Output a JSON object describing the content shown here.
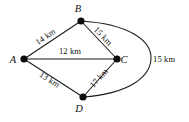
{
  "figure": {
    "background_color": "#ffffff",
    "line_color": "#1a1a1a",
    "node_color": "#0d0d0d",
    "text_color": "#111111"
  },
  "nodes": [
    {
      "id": "A",
      "label": "A",
      "x": 24,
      "y": 59,
      "label_x": 13,
      "label_y": 62.5,
      "radius": 3.6
    },
    {
      "id": "B",
      "label": "B",
      "x": 81,
      "y": 21,
      "label_x": 78,
      "label_y": 12,
      "radius": 3.6
    },
    {
      "id": "C",
      "label": "C",
      "x": 117,
      "y": 59,
      "label_x": 124,
      "label_y": 63,
      "radius": 3.6
    },
    {
      "id": "D",
      "label": "D",
      "x": 83,
      "y": 97,
      "label_x": 79,
      "label_y": 112,
      "radius": 3.6
    }
  ],
  "edges": [
    {
      "id": "AB",
      "from": "A",
      "to": "B",
      "shape": "line",
      "path": "M 24 59 L 81 21",
      "label": "14 km",
      "label_x": 47,
      "label_y": 39,
      "label_rotation": -33.7
    },
    {
      "id": "BC",
      "from": "B",
      "to": "C",
      "shape": "line",
      "path": "M 81 21 L 117 59",
      "label": "15 km",
      "label_x": 101,
      "label_y": 38,
      "label_rotation": 46.5
    },
    {
      "id": "AC",
      "from": "A",
      "to": "C",
      "shape": "line",
      "path": "M 24 59 L 117 59",
      "label": "12 km",
      "label_x": 70,
      "label_y": 54,
      "label_rotation": 0
    },
    {
      "id": "AD",
      "from": "A",
      "to": "D",
      "shape": "line",
      "path": "M 24 59 L 83 97",
      "label": "13 km",
      "label_x": 48,
      "label_y": 82,
      "label_rotation": 32.8
    },
    {
      "id": "DC",
      "from": "D",
      "to": "C",
      "shape": "line",
      "path": "M 83 97 L 117 59",
      "label": "17 km",
      "label_x": 101,
      "label_y": 80,
      "label_rotation": -48.2
    },
    {
      "id": "BD",
      "from": "B",
      "to": "D",
      "shape": "curve",
      "path": "M 81 21 C 128 24, 152 40, 151 59 C 150 78, 127 94, 83 97",
      "label": "15 km",
      "label_x": 153,
      "label_y": 62,
      "label_rotation": 0
    }
  ],
  "graph_data": {
    "type": "weighted-graph",
    "unit": "km",
    "vertices": [
      "A",
      "B",
      "C",
      "D"
    ],
    "weights": {
      "A-B": 14,
      "B-C": 15,
      "A-C": 12,
      "A-D": 13,
      "D-C": 17,
      "B-D": 15
    }
  }
}
